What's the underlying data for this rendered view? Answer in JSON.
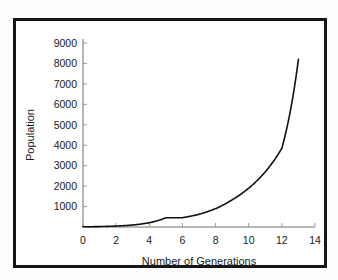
{
  "figure": {
    "background_color": "#fdfdfd",
    "frame_color": "#161616",
    "plot_background": "#ffffff",
    "caption_remnant": ""
  },
  "chart_data": {
    "type": "line",
    "title": "",
    "xlabel": "Number of Generations",
    "ylabel": "Population",
    "xlim": [
      0,
      14
    ],
    "ylim": [
      0,
      9000
    ],
    "grid": false,
    "legend": null,
    "line_color": "#111111",
    "x_ticks": [
      0,
      2,
      4,
      6,
      8,
      10,
      12,
      14
    ],
    "x_tick_labels": [
      "0",
      "2",
      "4",
      "6",
      "8",
      "10",
      "12",
      "14"
    ],
    "y_ticks": [
      1000,
      2000,
      3000,
      4000,
      5000,
      6000,
      7000,
      8000,
      9000
    ],
    "y_tick_labels": [
      "1000",
      "2000",
      "3000",
      "4000",
      "5000",
      "6000",
      "7000",
      "8000",
      "9000"
    ],
    "series": [
      {
        "name": "Population",
        "x": [
          0,
          1,
          2,
          3,
          4,
          5,
          6,
          7,
          8,
          9,
          10,
          11,
          12,
          13
        ],
        "values": [
          10,
          21,
          46,
          98,
          211,
          453,
          455,
          620,
          900,
          1330,
          1900,
          2700,
          3850,
          8200
        ]
      }
    ]
  }
}
